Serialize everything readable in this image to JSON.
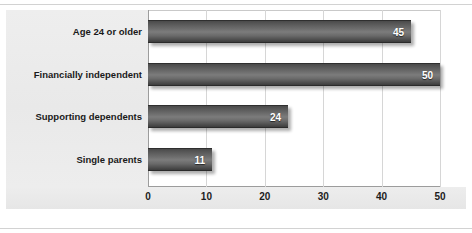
{
  "chart_data": {
    "type": "bar",
    "orientation": "horizontal",
    "title": "",
    "subtitle": "",
    "xlabel": "",
    "ylabel": "",
    "categories": [
      "Age 24 or older",
      "Financially independent",
      "Supporting dependents",
      "Single parents"
    ],
    "values": [
      45,
      50,
      24,
      11
    ],
    "value_labels": [
      "45",
      "50",
      "24",
      "11"
    ],
    "xlim": [
      0,
      50
    ],
    "xticks": [
      0,
      10,
      20,
      30,
      40,
      50
    ],
    "xtick_labels": [
      "0",
      "10",
      "20",
      "30",
      "40",
      "50"
    ],
    "grid": true,
    "grid_axis": "x",
    "legend": false,
    "legend_position": "none",
    "series": [
      {
        "name": "",
        "values": [
          45,
          50,
          24,
          11
        ]
      }
    ],
    "colors": {
      "bar_dark": "#4a4a4a",
      "bar_light": "#7c7c7c",
      "plot_background": "#ffffff",
      "label_gutter_background": "#ececec",
      "gridline": "#d6d6d6",
      "axis_line": "#9c9c9c",
      "value_label_text": "#ffffff",
      "tick_label_text": "#1c1c1c",
      "category_label_text": "#1a1a1a"
    }
  }
}
